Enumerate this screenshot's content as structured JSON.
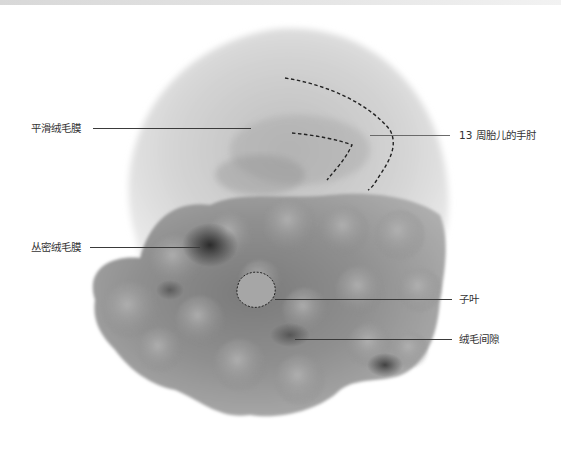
{
  "figure": {
    "labels": [
      {
        "id": "smooth-chorion",
        "text": "平滑绒毛膜",
        "side": "left"
      },
      {
        "id": "fetal-elbow",
        "text": "13 周胎儿的手肘",
        "side": "right"
      },
      {
        "id": "villous-chorion",
        "text": "丛密绒毛膜",
        "side": "left"
      },
      {
        "id": "cotyledon",
        "text": "子叶",
        "side": "right"
      },
      {
        "id": "intervillous-space",
        "text": "绒毛间隙",
        "side": "right"
      }
    ]
  },
  "colors": {
    "label_text": "#333333",
    "leader_line": "#3a3a3a",
    "background": "#ffffff"
  }
}
